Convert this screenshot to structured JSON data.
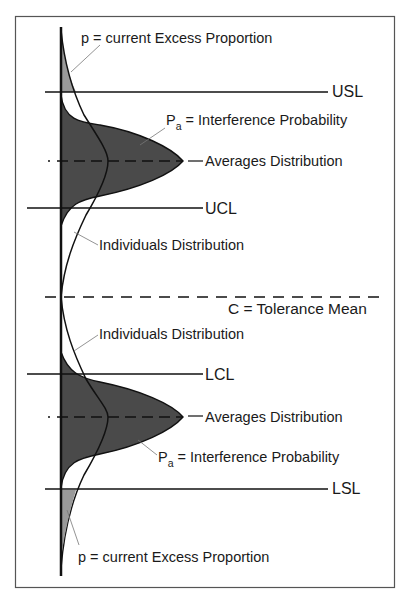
{
  "diagram": {
    "colors": {
      "dark_fill": "#4a4a4a",
      "light_fill": "#9a9a9a",
      "line": "#111111",
      "leader": "#666666",
      "frame": "#555555"
    },
    "labels": {
      "top_excess": "p = current Excess Proportion",
      "usl": "USL",
      "top_interference_p": "P",
      "top_interference_sub": "a",
      "top_interference_rest": " = Interference Probability",
      "top_averages": "Averages Distribution",
      "ucl": "UCL",
      "top_individuals": "Individuals Distribution",
      "tolerance_mean": "C = Tolerance Mean",
      "bottom_individuals": "Individuals Distribution",
      "lcl": "LCL",
      "bottom_averages": "Averages Distribution",
      "bottom_interference_p": "P",
      "bottom_interference_sub": "a",
      "bottom_interference_rest": " = Interference Probability",
      "lsl": "LSL",
      "bottom_excess": "p = current Excess Proportion"
    }
  }
}
